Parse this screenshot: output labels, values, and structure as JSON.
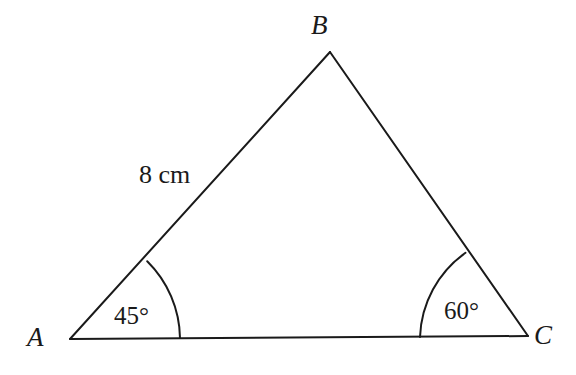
{
  "figure": {
    "kind": "triangle-diagram",
    "background_color": "#ffffff",
    "stroke_color": "#1a1a1a",
    "stroke_width": 2,
    "width": 576,
    "height": 375
  },
  "vertices": {
    "a": {
      "label": "A",
      "x": 70,
      "y": 339
    },
    "b": {
      "label": "B",
      "x": 330,
      "y": 52
    },
    "c": {
      "label": "C",
      "x": 528,
      "y": 336
    }
  },
  "sides": {
    "ab": {
      "label": "8 cm",
      "from": "A",
      "to": "B"
    },
    "bc": {
      "label": "",
      "from": "B",
      "to": "C"
    },
    "ac": {
      "label": "",
      "from": "A",
      "to": "C"
    }
  },
  "angles": {
    "at_a": {
      "label": "45°",
      "value": 45,
      "unit": "degrees",
      "arc_radius": 110
    },
    "at_c": {
      "label": "60°",
      "value": 60,
      "unit": "degrees",
      "arc_radius": 108
    }
  },
  "paths": {
    "side_ab": "M 70 339 L 330 52",
    "side_bc": "M 330 52 L 528 336",
    "side_ac": "M 70 339 L 528 336",
    "arc_at_a": "M 180 338 A 110 110 0 0 0 147.2 261.3",
    "arc_at_c": "M 420 337 A 108 108 0 0 1 465.5 252.8"
  }
}
